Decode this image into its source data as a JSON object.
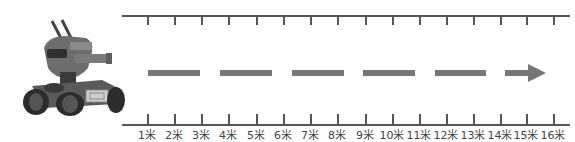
{
  "figure": {
    "unit": "米",
    "scale": {
      "labels": [
        "1米",
        "2米",
        "3米",
        "4米",
        "5米",
        "6米",
        "7米",
        "8米",
        "9米",
        "10米",
        "11米",
        "12米",
        "13米",
        "14米",
        "15米",
        "16米"
      ],
      "tick_x": [
        147,
        174,
        201,
        228,
        256,
        283,
        310,
        337,
        365,
        392,
        419,
        446,
        473,
        500,
        526,
        553
      ]
    },
    "path": {
      "style": "dashed-arrow",
      "dashes": [
        [
          148,
          200
        ],
        [
          220,
          272
        ],
        [
          292,
          344
        ],
        [
          363,
          415
        ],
        [
          435,
          486
        ]
      ],
      "arrow_start": 505,
      "arrow_end": 546,
      "direction": "right"
    },
    "colors": {
      "scale_line": "#555555",
      "dash": "#777777",
      "label": "#444444"
    }
  }
}
